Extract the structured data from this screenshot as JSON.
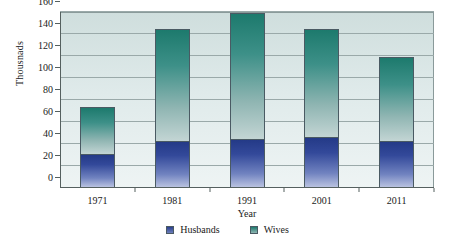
{
  "chart_data": {
    "type": "bar",
    "subtype": "stacked",
    "title": "",
    "xlabel": "Year",
    "ylabel": "Thousnads",
    "categories": [
      "1971",
      "1981",
      "1991",
      "2001",
      "2011"
    ],
    "series": [
      {
        "name": "Husbands",
        "values": [
          31,
          43,
          45,
          46,
          43
        ],
        "color": "#2a3f8d"
      },
      {
        "name": "Wives",
        "values": [
          43,
          102,
          114,
          99,
          76
        ],
        "color": "#1d7a6d"
      }
    ],
    "totals": [
      74,
      145,
      159,
      145,
      119
    ],
    "ylim": [
      0,
      160
    ],
    "yticks": [
      0,
      20,
      40,
      60,
      80,
      100,
      120,
      140,
      160
    ],
    "ytick_labels": [
      "0",
      "20",
      "40",
      "60",
      "80",
      "100",
      "120",
      "140",
      "160"
    ],
    "grid": true,
    "legend_position": "bottom",
    "legend": [
      "Husbands",
      "Wives"
    ]
  }
}
